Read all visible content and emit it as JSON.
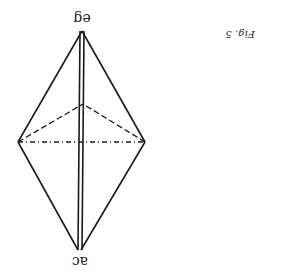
{
  "figure": {
    "caption": "Fig. 5",
    "orientation": "upside-down",
    "labels": {
      "top_vertex": "eg",
      "bottom_vertex": "ac"
    },
    "colors": {
      "ink": "#1a1a1a",
      "background": "#ffffff"
    }
  }
}
